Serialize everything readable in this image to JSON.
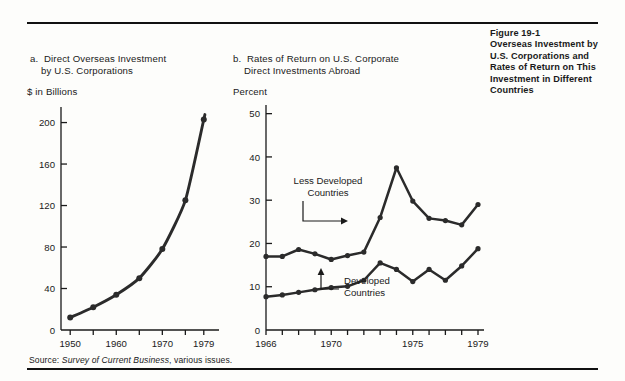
{
  "figure": {
    "caption_lines": [
      "Figure 19-1",
      "Overseas Investment by",
      "U.S. Corporations and",
      "Rates of Return on This",
      "Investment in Different",
      "Countries"
    ],
    "source_prefix": "Source:",
    "source_italic": "Survey of Current Business",
    "source_suffix": ", various issues."
  },
  "panel_a": {
    "label": "a.",
    "title_line1": "Direct Overseas Investment",
    "title_line2": "by U.S. Corporations",
    "unit": "$ in Billions"
  },
  "panel_b": {
    "label": "b.",
    "title_line1": "Rates of Return on U.S. Corporate",
    "title_line2": "Direct Investments Abroad",
    "unit": "Percent",
    "annotation_ldc_line1": "Less Developed",
    "annotation_ldc_line2": "Countries",
    "annotation_dev_line1": "Developed",
    "annotation_dev_line2": "Countries"
  },
  "chart_data": [
    {
      "id": "panel-a",
      "type": "line",
      "title": "a. Direct Overseas Investment by U.S. Corporations",
      "xlabel": "",
      "ylabel": "$ in Billions",
      "ylim": [
        0,
        215
      ],
      "xlim": [
        1948,
        1981
      ],
      "yticks": [
        0,
        40,
        80,
        120,
        160,
        200
      ],
      "ytick_labels": [
        "0",
        "40",
        "80",
        "120",
        "160",
        "200"
      ],
      "xticks": [
        1950,
        1955,
        1960,
        1965,
        1970,
        1975,
        1979
      ],
      "xtick_labels": [
        "1950",
        "",
        "1960",
        "",
        "1970",
        "",
        "1979"
      ],
      "grid": false,
      "legend": "none",
      "markers": true,
      "x": [
        1950,
        1955,
        1960,
        1965,
        1970,
        1975,
        1979
      ],
      "values": [
        12,
        22,
        34,
        50,
        78,
        125,
        203
      ]
    },
    {
      "id": "panel-b",
      "type": "line",
      "title": "b. Rates of Return on U.S. Corporate Direct Investments Abroad",
      "xlabel": "",
      "ylabel": "Percent",
      "ylim": [
        0,
        52
      ],
      "xlim": [
        1966,
        1979
      ],
      "yticks": [
        0,
        10,
        20,
        30,
        40,
        50
      ],
      "ytick_labels": [
        "0",
        "10",
        "20",
        "30",
        "40",
        "50"
      ],
      "xticks": [
        1966,
        1967,
        1968,
        1969,
        1970,
        1971,
        1972,
        1973,
        1974,
        1975,
        1976,
        1977,
        1978,
        1979
      ],
      "xtick_labels": [
        "1966",
        "",
        "",
        "",
        "1970",
        "",
        "",
        "",
        "",
        "1975",
        "",
        "",
        "",
        "1979"
      ],
      "grid": false,
      "legend": "inline-annotations",
      "markers": true,
      "x": [
        1966,
        1967,
        1968,
        1969,
        1970,
        1971,
        1972,
        1973,
        1974,
        1975,
        1976,
        1977,
        1978,
        1979
      ],
      "series": [
        {
          "name": "Less Developed Countries",
          "values": [
            17.0,
            17.0,
            18.6,
            17.6,
            16.3,
            17.2,
            18.0,
            26.0,
            37.5,
            29.8,
            25.8,
            25.3,
            24.3,
            29.0
          ]
        },
        {
          "name": "Developed Countries",
          "values": [
            7.7,
            8.1,
            8.7,
            9.3,
            9.8,
            10.1,
            11.5,
            15.5,
            14.0,
            11.2,
            14.0,
            11.5,
            14.8,
            18.8
          ]
        }
      ]
    }
  ],
  "colors": {
    "ink": "#1a1a1a",
    "line": "#2b2b2b",
    "axis": "#222222",
    "paper": "#fdfdfb"
  }
}
